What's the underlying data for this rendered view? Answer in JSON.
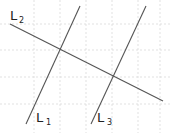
{
  "diagram": {
    "type": "geometry-lines-on-grid",
    "grid": {
      "vertical_x": [
        34,
        60,
        86,
        112,
        138,
        160
      ],
      "horizontal_y": [
        24,
        50,
        77,
        104
      ],
      "color": "#d9d9d9",
      "style": "dashed"
    },
    "line_color": "#555555",
    "lines": [
      {
        "id": "L1",
        "label": "L",
        "subscript": "1",
        "x1": 26,
        "y1": 124,
        "x2": 80,
        "y2": 6,
        "label_x": 36,
        "label_y": 122,
        "sub_x": 46,
        "sub_y": 125
      },
      {
        "id": "L2",
        "label": "L",
        "subscript": "2",
        "x1": 10,
        "y1": 24,
        "x2": 163,
        "y2": 101,
        "label_x": 10,
        "label_y": 20,
        "sub_x": 19,
        "sub_y": 23
      },
      {
        "id": "L3",
        "label": "L",
        "subscript": "3",
        "x1": 91,
        "y1": 124,
        "x2": 146,
        "y2": 6,
        "label_x": 97,
        "label_y": 122,
        "sub_x": 107,
        "sub_y": 125
      }
    ],
    "intersections": [
      {
        "lines": [
          "L1",
          "L2"
        ],
        "x": 60,
        "y": 50
      },
      {
        "lines": [
          "L3",
          "L2"
        ],
        "x": 113,
        "y": 78
      }
    ]
  }
}
